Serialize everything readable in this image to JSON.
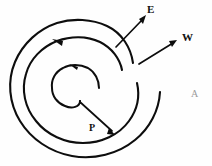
{
  "figure": {
    "type": "spiral-diagram",
    "background_color": "#fefefe",
    "stroke_color": "#0d0d0d"
  },
  "labels": {
    "e": "E",
    "w": "W",
    "p": "P",
    "a": "A"
  },
  "annotations": {
    "e_callout": {
      "label": "E",
      "arrow_direction": "up-right",
      "tip": [
        145,
        17
      ],
      "tail": [
        116,
        47
      ],
      "target": "spiral outer arm discontinuity"
    },
    "w_callout": {
      "label": "W",
      "arrow_direction": "up-right",
      "tip": [
        176,
        41
      ],
      "tail": [
        139,
        64
      ],
      "target": "spiral outermost arm"
    },
    "p_callout": {
      "label": "P",
      "arrow_direction": "down-right",
      "tip": [
        114,
        134
      ],
      "tail": [
        80,
        101
      ],
      "target": "spiral inner terminus"
    },
    "a_label": {
      "label": "A",
      "position": [
        191,
        89
      ],
      "faint": true
    }
  },
  "spiral": {
    "center": [
      76,
      88
    ],
    "turns": 2,
    "rotation_sense": "counterclockwise",
    "arrowheads": [
      {
        "name": "outer-arm-arrowhead",
        "position": [
          58,
          41
        ],
        "direction": "left"
      },
      {
        "name": "mid-arm-arrowhead",
        "position": [
          75,
          68
        ],
        "direction": "left"
      }
    ],
    "radii": {
      "outer": 68,
      "middle": 48,
      "inner": 20
    }
  },
  "colors": {
    "ink": "#0d0d0d",
    "paper": "#fefefe",
    "faint_ink": "#9a9a9a"
  }
}
